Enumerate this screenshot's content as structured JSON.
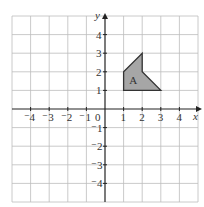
{
  "diagram": {
    "type": "coordinate-grid",
    "axes": {
      "x_label": "x",
      "y_label": "y",
      "origin_label": "0",
      "x_ticks": [
        {
          "value": -4,
          "label": "⁻4"
        },
        {
          "value": -3,
          "label": "⁻3"
        },
        {
          "value": -2,
          "label": "⁻2"
        },
        {
          "value": -1,
          "label": "⁻1"
        },
        {
          "value": 1,
          "label": "1"
        },
        {
          "value": 2,
          "label": "2"
        },
        {
          "value": 3,
          "label": "3"
        },
        {
          "value": 4,
          "label": "4"
        }
      ],
      "y_ticks": [
        {
          "value": 4,
          "label": "4"
        },
        {
          "value": 3,
          "label": "3"
        },
        {
          "value": 2,
          "label": "2"
        },
        {
          "value": 1,
          "label": "1"
        },
        {
          "value": -1,
          "label": "⁻1"
        },
        {
          "value": -2,
          "label": "⁻2"
        },
        {
          "value": -3,
          "label": "⁻3"
        },
        {
          "value": -4,
          "label": "⁻4"
        }
      ],
      "x_range": [
        -5,
        5
      ],
      "y_range": [
        -5,
        5
      ]
    },
    "shapes": [
      {
        "label": "A",
        "fill": "#a6a6a6",
        "stroke": "#333333",
        "vertices": [
          [
            1,
            1
          ],
          [
            1,
            2
          ],
          [
            2,
            3
          ],
          [
            2,
            2
          ],
          [
            3,
            1
          ]
        ]
      }
    ],
    "colors": {
      "grid": "#bdbdbd",
      "axis": "#222222",
      "background": "#ffffff"
    }
  }
}
